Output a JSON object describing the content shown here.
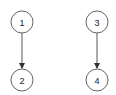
{
  "diagram": {
    "type": "directed-graph",
    "nodes": [
      {
        "id": "1",
        "label": "1",
        "cx": 22,
        "cy": 22
      },
      {
        "id": "2",
        "label": "2",
        "cx": 22,
        "cy": 80
      },
      {
        "id": "3",
        "label": "3",
        "cx": 97,
        "cy": 22
      },
      {
        "id": "4",
        "label": "4",
        "cx": 97,
        "cy": 80
      }
    ],
    "edges": [
      {
        "from": "1",
        "to": "2"
      },
      {
        "from": "3",
        "to": "4"
      }
    ],
    "colors": {
      "stroke": "#555555",
      "text": "#222222",
      "background": "#ffffff"
    }
  }
}
